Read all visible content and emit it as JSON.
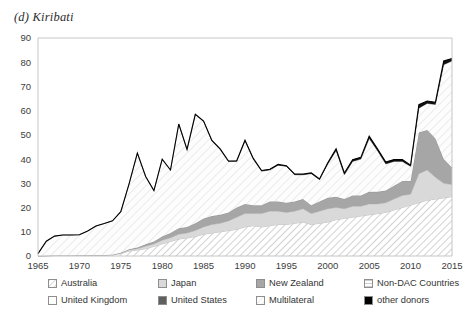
{
  "chart_title": "(d) Kiribati",
  "legend": {
    "items": [
      {
        "label": "Australia",
        "key": "australia",
        "swatch": "diagonal-hatch-up-light",
        "color": "#ffffff"
      },
      {
        "label": "Japan",
        "key": "japan",
        "swatch": "solid-light-gray",
        "color": "#d9d9d9"
      },
      {
        "label": "New Zealand",
        "key": "new_zealand",
        "swatch": "solid-medium-gray",
        "color": "#a6a6a6"
      },
      {
        "label": "Non-DAC Countries",
        "key": "non_dac",
        "swatch": "horizontal-lines",
        "color": "#ffffff"
      },
      {
        "label": "United Kingdom",
        "key": "united_kingdom",
        "swatch": "solid-white",
        "color": "#ffffff"
      },
      {
        "label": "United States",
        "key": "united_states",
        "swatch": "solid-dark-gray",
        "color": "#5f5f5f"
      },
      {
        "label": "Multilateral",
        "key": "multilateral",
        "swatch": "diagonal-hatch-faint",
        "color": "#fdfdfd"
      },
      {
        "label": "other donors",
        "key": "other_donors",
        "swatch": "solid-black",
        "color": "#000000"
      }
    ]
  },
  "chart_data": {
    "type": "area",
    "stacked": true,
    "title": "(d) Kiribati",
    "xlabel": "",
    "ylabel": "",
    "xlim": [
      1965,
      2015
    ],
    "ylim": [
      0,
      90
    ],
    "ytick_step": 10,
    "xtick_step": 5,
    "grid": false,
    "legend_position": "bottom",
    "yticks": [
      0,
      10,
      20,
      30,
      40,
      50,
      60,
      70,
      80,
      90
    ],
    "xticks": [
      1965,
      1970,
      1975,
      1980,
      1985,
      1990,
      1995,
      2000,
      2005,
      2010,
      2015
    ],
    "x": [
      1965,
      1966,
      1967,
      1968,
      1969,
      1970,
      1971,
      1972,
      1973,
      1974,
      1975,
      1976,
      1977,
      1978,
      1979,
      1980,
      1981,
      1982,
      1983,
      1984,
      1985,
      1986,
      1987,
      1988,
      1989,
      1990,
      1991,
      1992,
      1993,
      1994,
      1995,
      1996,
      1997,
      1998,
      1999,
      2000,
      2001,
      2002,
      2003,
      2004,
      2005,
      2006,
      2007,
      2008,
      2009,
      2010,
      2011,
      2012,
      2013,
      2014,
      2015
    ],
    "series": [
      {
        "name": "Australia",
        "values": [
          0.0,
          0.1,
          0.2,
          0.2,
          0.2,
          0.3,
          0.3,
          0.4,
          0.4,
          0.5,
          1.0,
          2.0,
          2.5,
          3.0,
          4.0,
          5.0,
          6.0,
          7.0,
          7.5,
          8.0,
          9.0,
          9.5,
          10.0,
          10.5,
          11.0,
          12.0,
          12.5,
          12.0,
          12.5,
          13.0,
          13.0,
          13.5,
          14.0,
          13.0,
          13.5,
          14.0,
          15.0,
          15.5,
          16.0,
          16.5,
          17.0,
          17.5,
          18.0,
          19.0,
          20.0,
          21.0,
          22.0,
          23.0,
          23.5,
          24.0,
          24.5
        ]
      },
      {
        "name": "Japan",
        "values": [
          0.0,
          0.0,
          0.0,
          0.0,
          0.0,
          0.0,
          0.0,
          0.0,
          0.0,
          0.0,
          0.3,
          0.5,
          0.5,
          1.0,
          1.0,
          1.5,
          1.5,
          2.0,
          2.0,
          2.5,
          3.0,
          3.5,
          3.5,
          4.0,
          5.0,
          5.5,
          5.0,
          5.5,
          6.0,
          5.5,
          5.0,
          5.0,
          5.5,
          4.5,
          5.0,
          5.5,
          5.0,
          4.0,
          4.5,
          4.0,
          4.5,
          4.0,
          4.0,
          4.5,
          5.0,
          4.5,
          12.0,
          12.5,
          9.0,
          6.0,
          5.0
        ]
      },
      {
        "name": "New Zealand",
        "values": [
          0.0,
          0.0,
          0.0,
          0.0,
          0.0,
          0.0,
          0.0,
          0.0,
          0.0,
          0.0,
          0.0,
          0.3,
          0.5,
          0.8,
          1.0,
          1.5,
          2.0,
          2.5,
          2.5,
          3.0,
          3.5,
          3.5,
          3.5,
          3.5,
          4.0,
          4.0,
          3.5,
          3.5,
          4.0,
          4.0,
          4.0,
          4.0,
          4.0,
          3.5,
          4.0,
          4.5,
          4.5,
          4.0,
          4.5,
          4.5,
          5.0,
          5.0,
          5.0,
          5.5,
          6.0,
          5.5,
          17.0,
          16.5,
          16.0,
          10.0,
          7.0
        ]
      },
      {
        "name": "Non-DAC Countries",
        "values": [
          0.0,
          0.0,
          0.0,
          0.0,
          0.0,
          0.0,
          0.0,
          0.0,
          0.0,
          0.0,
          0.0,
          0.0,
          0.0,
          0.0,
          0.0,
          0.0,
          0.0,
          0.0,
          0.0,
          0.0,
          0.0,
          0.0,
          0.0,
          0.0,
          0.0,
          0.0,
          0.0,
          0.0,
          0.0,
          0.0,
          0.0,
          0.0,
          0.0,
          0.0,
          0.0,
          0.0,
          0.0,
          0.0,
          0.0,
          0.0,
          0.0,
          0.0,
          0.0,
          0.0,
          0.0,
          0.0,
          0.0,
          0.0,
          0.0,
          0.0,
          0.0
        ]
      },
      {
        "name": "United Kingdom",
        "values": [
          0.0,
          0.0,
          0.0,
          0.0,
          0.0,
          0.0,
          0.0,
          0.0,
          0.0,
          0.0,
          0.0,
          0.0,
          0.0,
          0.0,
          0.0,
          0.0,
          0.0,
          0.0,
          0.0,
          0.0,
          0.0,
          0.0,
          0.0,
          0.0,
          0.0,
          0.0,
          0.0,
          0.0,
          0.0,
          0.0,
          0.0,
          0.0,
          0.0,
          0.0,
          0.0,
          0.0,
          0.0,
          0.0,
          0.0,
          0.0,
          0.0,
          0.0,
          0.0,
          0.0,
          0.0,
          0.0,
          0.0,
          0.0,
          0.0,
          0.0,
          0.0
        ]
      },
      {
        "name": "United States",
        "values": [
          0.0,
          0.0,
          0.0,
          0.0,
          0.0,
          0.0,
          0.0,
          0.0,
          0.0,
          0.0,
          0.0,
          0.0,
          0.0,
          0.0,
          0.0,
          0.0,
          0.0,
          0.0,
          0.0,
          0.0,
          0.0,
          0.0,
          0.0,
          0.0,
          0.0,
          0.0,
          0.0,
          0.0,
          0.0,
          0.0,
          0.0,
          0.0,
          0.0,
          0.0,
          0.0,
          0.0,
          0.0,
          0.0,
          0.0,
          0.0,
          0.0,
          0.0,
          0.0,
          0.0,
          0.0,
          0.0,
          0.0,
          0.0,
          0.0,
          0.0,
          0.0
        ]
      },
      {
        "name": "Multilateral",
        "values": [
          1.0,
          6.0,
          8.0,
          8.5,
          8.5,
          8.5,
          10.0,
          12.0,
          13.0,
          14.0,
          17.0,
          27.0,
          39.0,
          28.0,
          21.0,
          32.0,
          26.0,
          43.0,
          32.0,
          45.0,
          40.0,
          31.0,
          27.0,
          21.0,
          19.0,
          26.0,
          19.0,
          14.0,
          13.0,
          15.0,
          15.0,
          11.0,
          10.0,
          13.0,
          9.0,
          14.0,
          19.0,
          10.0,
          14.0,
          15.0,
          22.0,
          17.0,
          11.0,
          10.0,
          8.0,
          6.0,
          10.0,
          11.0,
          14.0,
          39.0,
          44.0
        ]
      },
      {
        "name": "other donors",
        "values": [
          0.0,
          0.0,
          0.0,
          0.0,
          0.0,
          0.0,
          0.0,
          0.0,
          0.0,
          0.0,
          0.0,
          0.0,
          0.0,
          0.0,
          0.0,
          0.0,
          0.0,
          0.0,
          0.0,
          0.0,
          0.2,
          0.2,
          0.2,
          0.2,
          0.3,
          0.3,
          0.3,
          0.3,
          0.3,
          0.3,
          0.3,
          0.3,
          0.3,
          0.3,
          0.3,
          0.5,
          0.8,
          0.8,
          0.8,
          0.8,
          1.0,
          0.8,
          0.8,
          0.8,
          0.8,
          0.5,
          1.5,
          1.0,
          1.0,
          1.5,
          1.0
        ]
      }
    ]
  }
}
